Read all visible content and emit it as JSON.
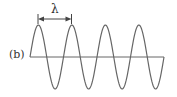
{
  "figure": {
    "panel_label": "(b)",
    "wavelength_symbol": "λ",
    "wave": {
      "cycles": 4,
      "start_x": 30,
      "wavelength_px": 33.5,
      "baseline_y": 57,
      "amplitude_px": 32,
      "color": "#666666"
    },
    "arrow": {
      "from_x": 38,
      "to_x": 71.5,
      "y": 19
    }
  }
}
